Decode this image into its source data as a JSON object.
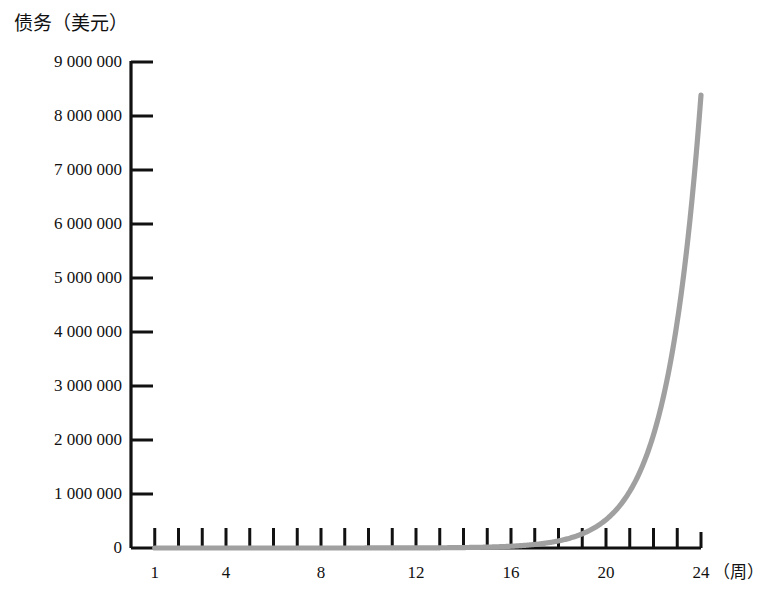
{
  "chart_data": {
    "type": "line",
    "title": "",
    "ylabel": "债务（美元）",
    "xlabel": "（周）",
    "x_unit_label": "（周）",
    "grid": false,
    "legend": "none",
    "curve_color": "#a0a0a0",
    "axis_color": "#111111",
    "xlim": [
      0,
      24
    ],
    "ylim": [
      0,
      9000000
    ],
    "x_tick_values": [
      1,
      2,
      3,
      4,
      5,
      6,
      7,
      8,
      9,
      10,
      11,
      12,
      13,
      14,
      15,
      16,
      17,
      18,
      19,
      20,
      21,
      22,
      23,
      24
    ],
    "x_tick_labels": [
      "1",
      "4",
      "8",
      "12",
      "16",
      "20",
      "24"
    ],
    "x_labeled_values": [
      1,
      4,
      8,
      12,
      16,
      20,
      24
    ],
    "y_tick_values": [
      0,
      1000000,
      2000000,
      3000000,
      4000000,
      5000000,
      6000000,
      7000000,
      8000000,
      9000000
    ],
    "y_tick_labels": [
      "0",
      "1 000 000",
      "2 000 000",
      "3 000 000",
      "4 000 000",
      "5 000 000",
      "6 000 000",
      "7 000 000",
      "8 000 000",
      "9 000 000"
    ],
    "series": [
      {
        "name": "债务",
        "x": [
          1,
          2,
          3,
          4,
          5,
          6,
          7,
          8,
          9,
          10,
          11,
          12,
          13,
          14,
          15,
          16,
          17,
          18,
          19,
          20,
          21,
          22,
          23,
          24
        ],
        "values": [
          1,
          2,
          4,
          8,
          16,
          32,
          64,
          128,
          256,
          512,
          1024,
          2048,
          4096,
          8192,
          16384,
          32768,
          65536,
          131072,
          262144,
          524288,
          1048576,
          2097152,
          4194304,
          8388608
        ]
      }
    ]
  }
}
